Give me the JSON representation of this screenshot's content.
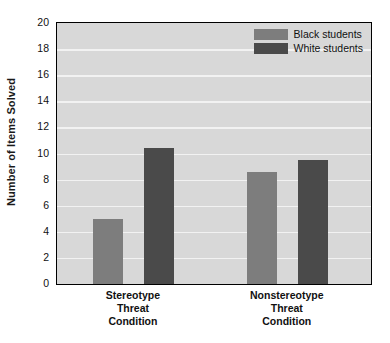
{
  "chart_data": {
    "type": "bar",
    "title": "",
    "xlabel": "",
    "ylabel": "Number of Items Solved",
    "ylim": [
      0,
      20
    ],
    "ytick_step": 2,
    "yticks": [
      20,
      18,
      16,
      14,
      12,
      10,
      8,
      6,
      4,
      2,
      0
    ],
    "ytick_labels": [
      "20",
      "18",
      "16",
      "14",
      "12",
      "10",
      "8",
      "6",
      "4",
      "2",
      "0"
    ],
    "categories": [
      "Stereotype Threat Condition",
      "Nonstereotype Threat Condition"
    ],
    "category_lines": [
      [
        "Stereotype",
        "Threat",
        "Condition"
      ],
      [
        "Nonstereotype",
        "Threat",
        "Condition"
      ]
    ],
    "series": [
      {
        "name": "Black students",
        "color": "#7d7d7d",
        "values": [
          5.0,
          8.6
        ]
      },
      {
        "name": "White students",
        "color": "#4a4a4a",
        "values": [
          10.4,
          9.5
        ]
      }
    ],
    "legend_position": "top-right",
    "grid": true,
    "grid_axis": "y",
    "plot_background": "#d8d8d8",
    "grid_color": "#f2f2f2",
    "frame_color": "#000000"
  }
}
